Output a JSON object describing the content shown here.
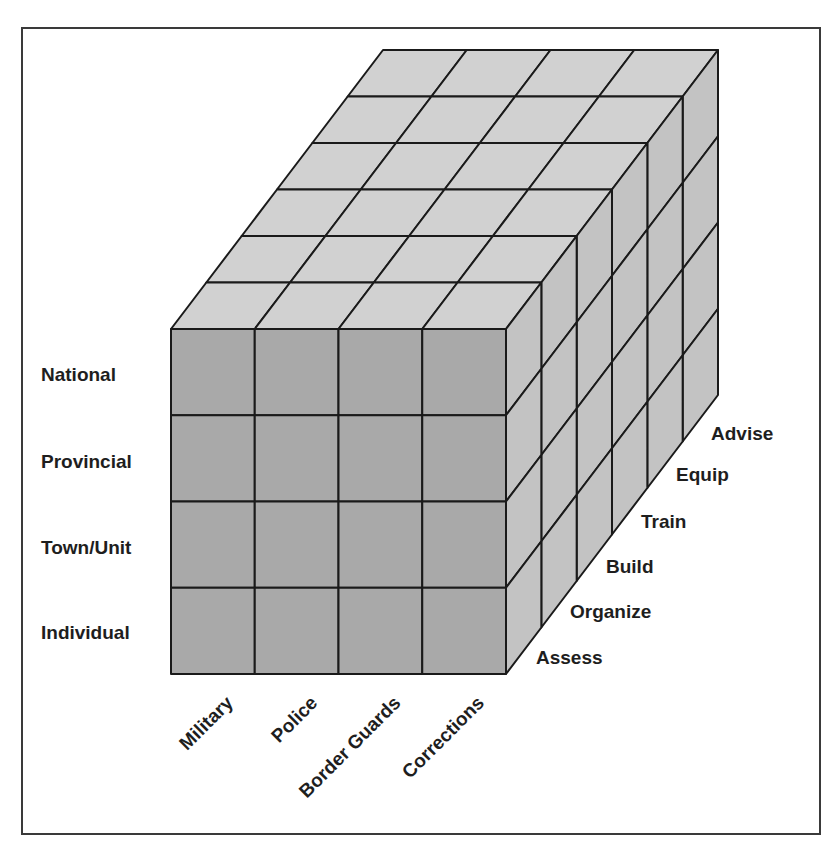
{
  "diagram": {
    "type": "3d-cube-matrix",
    "colors": {
      "front_face": "#a9a9a9",
      "top_face": "#d1d1d1",
      "side_face": "#c3c3c3",
      "grid_line": "#1a1a1a",
      "frame": "#3a3a3a",
      "text": "#1e1e1e"
    },
    "front_rows": {
      "axis": "level",
      "labels": [
        "National",
        "Provincial",
        "Town/Unit",
        "Individual"
      ]
    },
    "front_columns": {
      "axis": "force",
      "labels": [
        "Military",
        "Police",
        "Border Guards",
        "Corrections"
      ]
    },
    "depth": {
      "axis": "activity",
      "labels": [
        "Assess",
        "Organize",
        "Build",
        "Train",
        "Equip",
        "Advise"
      ]
    }
  }
}
